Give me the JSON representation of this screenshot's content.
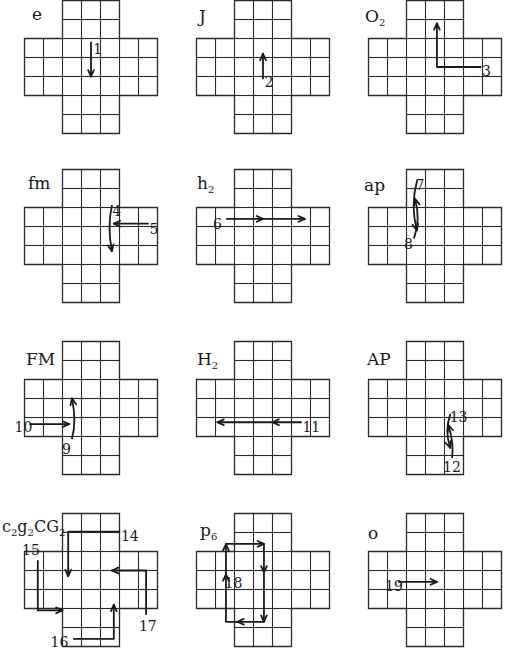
{
  "diagram": {
    "cell_px": 19,
    "cross_shape": {
      "columns": 7,
      "rows": 7,
      "arm_width": 3,
      "arm_length": 2
    },
    "line_color": "#2a2a2a",
    "arrow_color": "#1a1a1a",
    "panels": [
      {
        "id": "e",
        "label": "e",
        "x": 24,
        "y": 0,
        "label_x": 8,
        "label_y": 4,
        "arrows": [
          {
            "num": "1",
            "points": [
              [
                3.5,
                2.2
              ],
              [
                3.5,
                4.0
              ]
            ],
            "num_pos": [
              3.65,
              2.6
            ]
          }
        ]
      },
      {
        "id": "J",
        "label": "J",
        "x": 196,
        "y": 0,
        "label_x": 3,
        "label_y": 6,
        "arrows": [
          {
            "num": "2",
            "points": [
              [
                3.5,
                4.1
              ],
              [
                3.5,
                2.8
              ]
            ],
            "num_pos": [
              3.6,
              4.3
            ]
          }
        ]
      },
      {
        "id": "O2",
        "label": "O",
        "label_sub": "2",
        "x": 368,
        "y": 0,
        "label_x": -3,
        "label_y": 6,
        "arrows": [
          {
            "num": "3",
            "points": [
              [
                5.9,
                3.5
              ],
              [
                3.6,
                3.5
              ],
              [
                3.6,
                1.2
              ]
            ],
            "num_pos": [
              6.0,
              3.75
            ]
          }
        ]
      },
      {
        "id": "fm",
        "label": "fm",
        "x": 24,
        "y": 169,
        "label_x": 4,
        "label_y": 4,
        "arrows": [
          {
            "num": "4",
            "points": [
              [
                4.6,
                1.9
              ],
              [
                4.35,
                3.0
              ],
              [
                4.6,
                4.3
              ]
            ],
            "curved": true,
            "num_pos": [
              4.65,
              2.2
            ]
          },
          {
            "num": "5",
            "points": [
              [
                6.5,
                2.85
              ],
              [
                4.7,
                2.85
              ]
            ],
            "num_pos": [
              6.6,
              3.15
            ]
          }
        ]
      },
      {
        "id": "h2",
        "label": "h",
        "label_sub": "2",
        "x": 196,
        "y": 169,
        "label_x": 1,
        "label_y": 4,
        "arrows": [
          {
            "num": "6",
            "points": [
              [
                1.6,
                2.6
              ],
              [
                3.5,
                2.6
              ],
              [
                5.7,
                2.6
              ]
            ],
            "mid_head": true,
            "num_pos": [
              0.9,
              2.9
            ]
          }
        ]
      },
      {
        "id": "ap",
        "label": "ap",
        "x": 368,
        "y": 169,
        "label_x": -4,
        "label_y": 6,
        "arrows": [
          {
            "num": "7",
            "points": [
              [
                2.55,
                0.6
              ],
              [
                2.2,
                1.9
              ],
              [
                2.55,
                3.2
              ]
            ],
            "curved": true,
            "num_pos": [
              2.5,
              0.85
            ]
          },
          {
            "num": "8",
            "points": [
              [
                2.4,
                3.6
              ],
              [
                2.75,
                2.6
              ],
              [
                2.45,
                1.55
              ]
            ],
            "curved": true,
            "num_pos": [
              1.9,
              3.95
            ]
          }
        ]
      },
      {
        "id": "FM",
        "label": "FM",
        "x": 24,
        "y": 341,
        "label_x": 2,
        "label_y": 8,
        "arrows": [
          {
            "num": "9",
            "points": [
              [
                2.5,
                5.1
              ],
              [
                2.75,
                4.2
              ],
              [
                2.5,
                3.0
              ]
            ],
            "curved": true,
            "num_pos": [
              2.0,
              5.7
            ]
          },
          {
            "num": "10",
            "points": [
              [
                0.3,
                4.35
              ],
              [
                2.35,
                4.35
              ]
            ],
            "num_pos": [
              -0.5,
              4.55
            ]
          }
        ]
      },
      {
        "id": "H2",
        "label": "H",
        "label_sub": "2",
        "x": 196,
        "y": 341,
        "label_x": 1,
        "label_y": 8,
        "arrows": [
          {
            "num": "11",
            "points": [
              [
                5.5,
                4.25
              ],
              [
                4.0,
                4.25
              ],
              [
                1.1,
                4.25
              ]
            ],
            "mid_head": true,
            "num_pos": [
              5.6,
              4.55
            ]
          }
        ]
      },
      {
        "id": "AP",
        "label": "AP",
        "x": 368,
        "y": 341,
        "label_x": -1,
        "label_y": 8,
        "arrows": [
          {
            "num": "13",
            "points": [
              [
                4.3,
                3.85
              ],
              [
                4.0,
                4.7
              ],
              [
                4.3,
                5.6
              ]
            ],
            "curved": true,
            "num_pos": [
              4.3,
              4.0
            ]
          },
          {
            "num": "12",
            "points": [
              [
                4.4,
                6.1
              ],
              [
                4.5,
                5.3
              ],
              [
                4.2,
                4.4
              ]
            ],
            "curved": true,
            "num_pos": [
              3.95,
              6.65
            ]
          }
        ]
      },
      {
        "id": "c2g2CG2",
        "label": "c",
        "label_extra": "g",
        "label_cg": "CG",
        "x": 24,
        "y": 513,
        "label_x": -22,
        "label_y": 4,
        "arrows": [
          {
            "num": "14",
            "points": [
              [
                5.0,
                0.95
              ],
              [
                2.3,
                0.95
              ],
              [
                2.3,
                3.3
              ]
            ],
            "num_pos": [
              5.1,
              1.2
            ]
          },
          {
            "num": "15",
            "points": [
              [
                0.7,
                2.5
              ],
              [
                0.7,
                4.8
              ],
              [
                0.7,
                5.1
              ],
              [
                2.0,
                5.1
              ]
            ],
            "num_pos": [
              -0.1,
              1.95
            ]
          },
          {
            "num": "16",
            "points": [
              [
                2.6,
                6.6
              ],
              [
                4.7,
                6.6
              ],
              [
                4.7,
                4.8
              ]
            ],
            "num_pos": [
              1.4,
              6.8
            ]
          },
          {
            "num": "17",
            "points": [
              [
                6.4,
                5.3
              ],
              [
                6.4,
                3.3
              ],
              [
                6.4,
                3.0
              ],
              [
                4.6,
                3.0
              ]
            ],
            "num_pos": [
              6.05,
              5.95
            ]
          }
        ]
      },
      {
        "id": "p6",
        "label": "p",
        "label_sub": "6",
        "x": 196,
        "y": 513,
        "label_x": 4,
        "label_y": 7,
        "arrows": [
          {
            "num": "18",
            "loop": true,
            "num_pos": [
              1.5,
              3.7
            ]
          }
        ]
      },
      {
        "id": "o",
        "label": "o",
        "x": 368,
        "y": 513,
        "label_x": 0,
        "label_y": 10,
        "arrows": [
          {
            "num": "19",
            "points": [
              [
                1.6,
                3.6
              ],
              [
                3.6,
                3.6
              ]
            ],
            "num_pos": [
              0.9,
              3.85
            ]
          }
        ]
      }
    ]
  }
}
